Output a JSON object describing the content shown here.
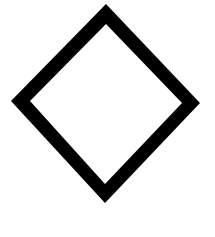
{
  "diagram": {
    "shape": "diamond",
    "fill": "#ffffff",
    "stroke": "#000000",
    "background": "#ffffff",
    "outer_points": "106,4 200,103 105,203 11,101",
    "inner_points": "106,24 182,103 105,184 30,101"
  }
}
